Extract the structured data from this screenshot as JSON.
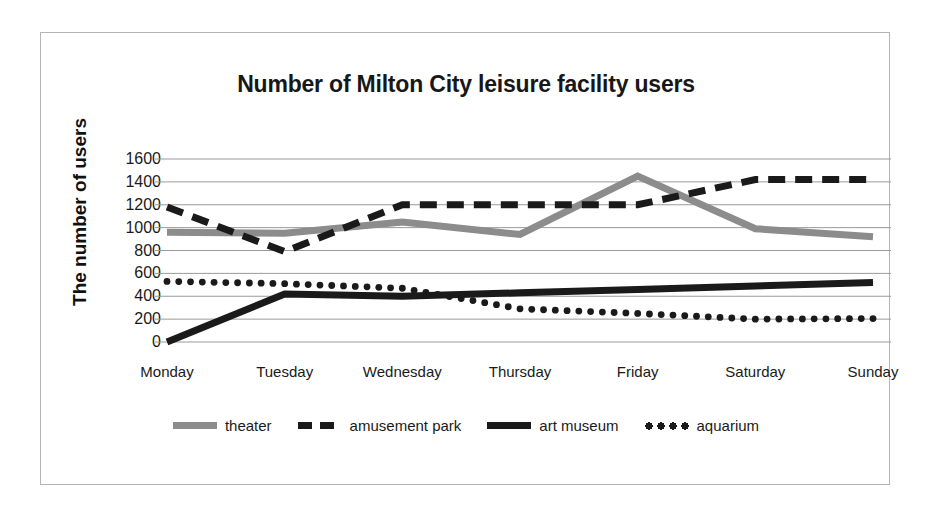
{
  "chart_data": {
    "type": "line",
    "title": "Number of Milton City leisure facility users",
    "xlabel": "",
    "ylabel": "The number of users",
    "categories": [
      "Monday",
      "Tuesday",
      "Wednesday",
      "Thursday",
      "Friday",
      "Saturday",
      "Sunday"
    ],
    "ylim": [
      0,
      1600
    ],
    "ytick_labels": [
      "1600",
      "1400",
      "1200",
      "1000",
      "800",
      "600",
      "400",
      "200",
      "0"
    ],
    "ytick_values": [
      1600,
      1400,
      1200,
      1000,
      800,
      600,
      400,
      200,
      0
    ],
    "grid": true,
    "legend_position": "bottom",
    "series": [
      {
        "name": "theater",
        "style": "solid",
        "color": "#8c8c8c",
        "values": [
          960,
          950,
          1050,
          940,
          1450,
          990,
          920
        ]
      },
      {
        "name": "amusement park",
        "style": "dashed",
        "color": "#1a1a1a",
        "values": [
          1180,
          790,
          1200,
          1200,
          1200,
          1420,
          1420
        ]
      },
      {
        "name": "art museum",
        "style": "solid",
        "color": "#1a1a1a",
        "values": [
          0,
          420,
          400,
          430,
          460,
          490,
          520
        ]
      },
      {
        "name": "aquarium",
        "style": "dotted",
        "color": "#1a1a1a",
        "values": [
          530,
          510,
          470,
          290,
          250,
          200,
          205
        ]
      }
    ]
  }
}
